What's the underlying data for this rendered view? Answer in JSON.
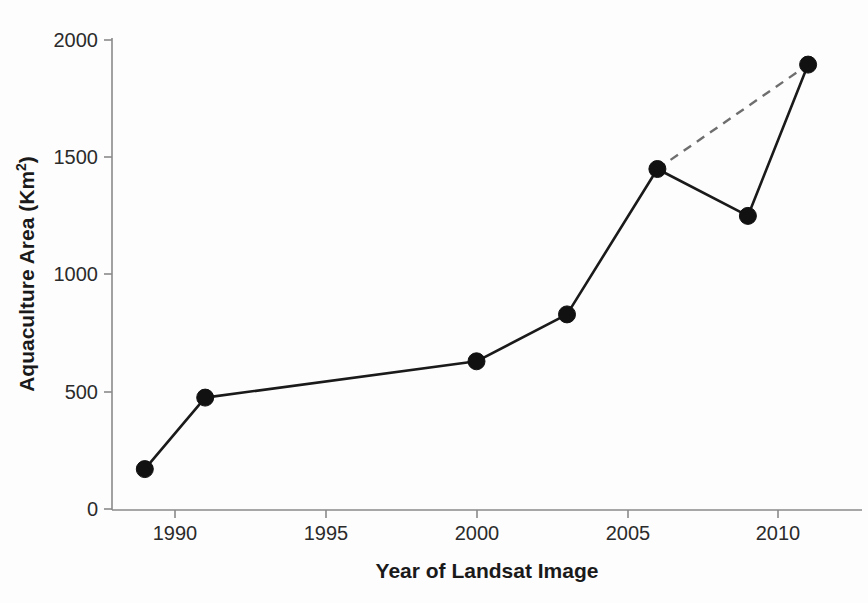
{
  "chart_data": {
    "type": "line",
    "title": "",
    "xlabel": "Year of Landsat Image",
    "ylabel": "Aquaculture Area (Km²)",
    "ylabel_base": "Aquaculture Area (Km",
    "ylabel_sup": "2",
    "ylabel_close": ")",
    "xlim": [
      1987.8,
      2012.5
    ],
    "ylim": [
      0,
      2050
    ],
    "grid": false,
    "legend": "none",
    "x_ticks": [
      1990,
      1995,
      2000,
      2005,
      2010
    ],
    "x_tick_labels": [
      "1990",
      "1995",
      "2000",
      "2005",
      "2010"
    ],
    "y_ticks": [
      0,
      500,
      1000,
      1500,
      2000
    ],
    "y_tick_labels": [
      "0",
      "500",
      "1000",
      "1500",
      "2000"
    ],
    "series": [
      {
        "name": "Aquaculture area (observed)",
        "style": "solid",
        "marker": "filled-circle",
        "color": "#111111",
        "x": [
          1989,
          1991,
          2000,
          2003,
          2006,
          2009,
          2011
        ],
        "values": [
          170,
          475,
          630,
          830,
          1450,
          1250,
          1895
        ]
      },
      {
        "name": "Trend 2006 to 2011",
        "style": "dashed",
        "marker": "none",
        "color": "#6e6e6e",
        "x": [
          2006,
          2011
        ],
        "values": [
          1450,
          1895
        ]
      }
    ],
    "points": [
      {
        "year": 1989,
        "value": 170
      },
      {
        "year": 1991,
        "value": 475
      },
      {
        "year": 2000,
        "value": 630
      },
      {
        "year": 2003,
        "value": 830
      },
      {
        "year": 2006,
        "value": 1450
      },
      {
        "year": 2009,
        "value": 1250
      },
      {
        "year": 2011,
        "value": 1895
      }
    ],
    "colors": {
      "line": "#111111",
      "dashed_line": "#6e6e6e",
      "marker": "#111111",
      "axis": "#8a8a8a",
      "text": "#1a1a1a",
      "background": "#fdfdfd"
    }
  }
}
